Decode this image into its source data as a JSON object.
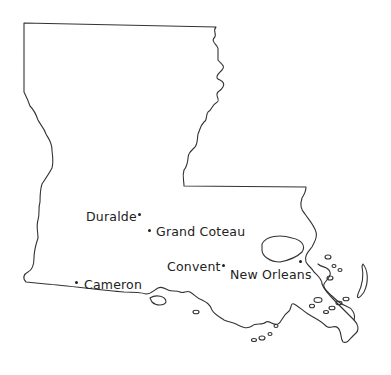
{
  "map": {
    "region": "Louisiana",
    "colors": {
      "outline": "#333333",
      "background": "#ffffff",
      "text": "#222222"
    },
    "cities": [
      {
        "name": "Duralde",
        "label_x": 86,
        "label_y": 212,
        "dot_x": 139,
        "dot_y": 214
      },
      {
        "name": "Grand Coteau",
        "label_x": 156,
        "label_y": 228,
        "dot_x": 149,
        "dot_y": 230
      },
      {
        "name": "Convent",
        "label_x": 167,
        "label_y": 262,
        "dot_x": 223,
        "dot_y": 265
      },
      {
        "name": "New Orleans",
        "label_x": 230,
        "label_y": 270,
        "dot_x": 300,
        "dot_y": 261
      },
      {
        "name": "Cameron",
        "label_x": 84,
        "label_y": 280,
        "dot_x": 76,
        "dot_y": 282
      }
    ]
  }
}
